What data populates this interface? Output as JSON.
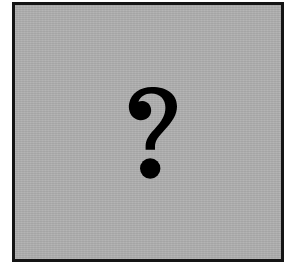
{
  "image": {
    "kind": "placeholder-graphic",
    "alt_text": "?",
    "width": 306,
    "height": 267,
    "background_color": "#ffffff"
  },
  "frame": {
    "name": "image-placeholder-frame",
    "border_color": "#141414",
    "border_width": 3,
    "fill_color": "#afafaf",
    "left": 12,
    "top": 2,
    "width": 272,
    "height": 260,
    "texture": "scanline"
  },
  "glyph": {
    "character": "?",
    "semantic_name": "question-mark-icon",
    "color": "#000000",
    "left": 128,
    "top": 85,
    "width": 62,
    "height": 100,
    "dot": {
      "center_x": 150,
      "center_y": 167,
      "radius": 10
    }
  }
}
